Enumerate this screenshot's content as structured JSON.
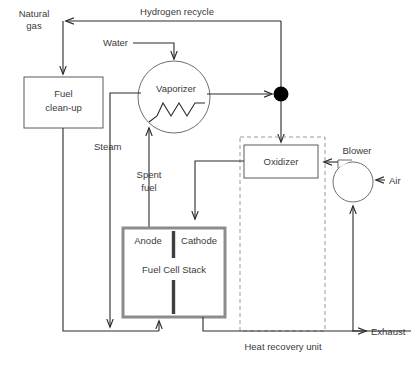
{
  "diagram": {
    "type": "process-flow-diagram"
  },
  "nodes": {
    "fuel_cleanup": {
      "line1": "Fuel",
      "line2": "clean-up"
    },
    "vaporizer": {
      "label": "Vaporizer"
    },
    "oxidizer": {
      "label": "Oxidizer"
    },
    "blower": {
      "label": "Blower"
    },
    "stack": {
      "label": "Fuel Cell Stack",
      "anode": "Anode",
      "cathode": "Cathode"
    },
    "heat_recovery": {
      "label": "Heat recovery unit"
    }
  },
  "streams": {
    "natural_gas": {
      "line1": "Natural",
      "line2": "gas"
    },
    "hydrogen_recycle": {
      "label": "Hydrogen recycle"
    },
    "water": {
      "label": "Water"
    },
    "steam": {
      "label": "Steam"
    },
    "spent_fuel": {
      "line1": "Spent",
      "line2": "fuel"
    },
    "air": {
      "label": "Air"
    },
    "exhaust": {
      "label": "Exhaust"
    }
  },
  "colors": {
    "line": "#2b2b2b",
    "text": "#3a3a3a",
    "box_border": "#5a5a5a",
    "stack_border": "#8c8c8c",
    "dashed_border": "#9a9a9a",
    "junction_dot": "#000000",
    "background": "#ffffff"
  }
}
